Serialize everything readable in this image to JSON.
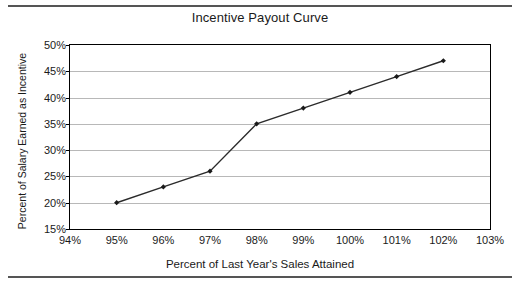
{
  "chart_data": {
    "type": "line",
    "title": "Incentive Payout Curve",
    "xlabel": "Percent of Last Year's Sales Attained",
    "ylabel": "Percent of Salary Earned as Incentive",
    "x": [
      95,
      96,
      97,
      98,
      99,
      100,
      101,
      102
    ],
    "values": [
      20,
      23,
      26,
      35,
      38,
      41,
      44,
      47
    ],
    "x_tick_labels": [
      "94%",
      "95%",
      "96%",
      "97%",
      "98%",
      "99%",
      "100%",
      "101%",
      "102%",
      "103%"
    ],
    "x_ticks": [
      94,
      95,
      96,
      97,
      98,
      99,
      100,
      101,
      102,
      103
    ],
    "y_tick_labels": [
      "15%",
      "20%",
      "25%",
      "30%",
      "35%",
      "40%",
      "45%",
      "50%"
    ],
    "y_ticks": [
      15,
      20,
      25,
      30,
      35,
      40,
      45,
      50
    ],
    "xlim": [
      94,
      103
    ],
    "ylim": [
      15,
      50
    ],
    "grid": "horizontal",
    "legend": "none",
    "series": [
      {
        "name": "Incentive Payout",
        "points": [
          {
            "x": 95,
            "y": 20,
            "label": "95%",
            "value_label": "20%"
          },
          {
            "x": 96,
            "y": 23,
            "label": "96%",
            "value_label": "23%"
          },
          {
            "x": 97,
            "y": 26,
            "label": "97%",
            "value_label": "26%"
          },
          {
            "x": 98,
            "y": 35,
            "label": "98%",
            "value_label": "35%"
          },
          {
            "x": 99,
            "y": 38,
            "label": "99%",
            "value_label": "38%"
          },
          {
            "x": 100,
            "y": 41,
            "label": "100%",
            "value_label": "41%"
          },
          {
            "x": 101,
            "y": 44,
            "label": "101%",
            "value_label": "44%"
          },
          {
            "x": 102,
            "y": 47,
            "label": "102%",
            "value_label": "47%"
          }
        ],
        "line_color": "#2b2b2b",
        "marker_color": "#1a1a1a",
        "marker": "diamond"
      }
    ],
    "colors": {
      "gridline": "#b8b8b8",
      "axis": "#000000",
      "background": "#ffffff",
      "text": "#1a1a1a",
      "rule": "#555555"
    }
  }
}
